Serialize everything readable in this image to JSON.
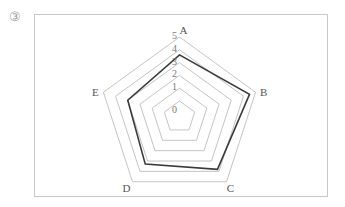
{
  "figure": {
    "number_label": "③"
  },
  "chart_data": {
    "type": "radar",
    "title": "",
    "axes": [
      "A",
      "B",
      "C",
      "D",
      "E"
    ],
    "radial_ticks": [
      "0",
      "1",
      "2",
      "3",
      "4",
      "5"
    ],
    "rlim": [
      0,
      5
    ],
    "grid": true,
    "inner_offset_level0": true,
    "series": [
      {
        "name": "",
        "values": [
          3.6,
          4.5,
          3.8,
          3.3,
          3.0
        ],
        "color": "#3a3a3a"
      }
    ],
    "grid_color": "#bdbdbd"
  }
}
